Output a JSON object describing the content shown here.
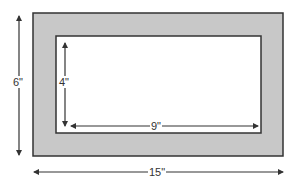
{
  "diagram": {
    "type": "framed-picture-dimensions",
    "outer_frame": {
      "height_label": "6\"",
      "width_label": "15\"",
      "fill": "#c8c8c8",
      "stroke": "#333333"
    },
    "inner_picture": {
      "height_label": "4\"",
      "width_label": "9\"",
      "fill": "#ffffff",
      "stroke": "#333333"
    },
    "arrow_color": "#333333"
  }
}
